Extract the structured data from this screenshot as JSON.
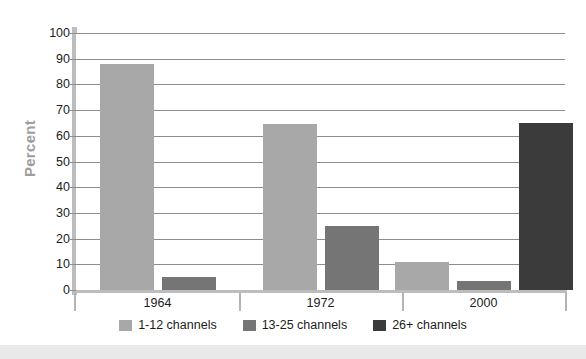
{
  "chart_data": {
    "type": "bar",
    "title": "",
    "subtitle": "",
    "xlabel": "",
    "ylabel": "Percent",
    "ylim": [
      0,
      100
    ],
    "ytick_values": [
      0,
      10,
      20,
      30,
      40,
      50,
      60,
      70,
      80,
      90,
      100
    ],
    "ytick_labels": [
      "0",
      "10",
      "20",
      "30",
      "40",
      "50",
      "60",
      "70",
      "80",
      "90",
      "100"
    ],
    "categories": [
      "1964",
      "1972",
      "2000"
    ],
    "grid": "horizontal",
    "legend_position": "bottom-center",
    "series": [
      {
        "name": "1-12 channels",
        "color": "#a8a8a8",
        "values": [
          88,
          64.5,
          11
        ]
      },
      {
        "name": "13-25 channels",
        "color": "#757575",
        "values": [
          5,
          25,
          3.5
        ]
      },
      {
        "name": "26+ channels",
        "color": "#3b3b3b",
        "values": [
          null,
          null,
          65
        ]
      }
    ]
  },
  "colors": {
    "background": "#ffffff",
    "axis_spine": "#bdbdbd",
    "gridline": "#8d8d8d",
    "tick_text": "#1c1c1c",
    "axis_title": "#9d9d9d",
    "bottom_band": "#e9e9e9"
  }
}
